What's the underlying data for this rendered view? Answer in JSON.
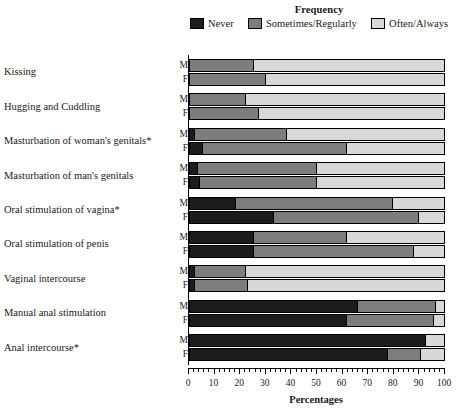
{
  "chart_data": {
    "type": "bar",
    "orientation": "horizontal",
    "stacked": true,
    "stack_total": 100,
    "title": "",
    "legend_title": "Frequency",
    "legend_position": "top",
    "xlabel": "Percentages",
    "ylabel": "",
    "xlim": [
      0,
      100
    ],
    "xticks": [
      0,
      10,
      20,
      30,
      40,
      50,
      60,
      70,
      80,
      90,
      100
    ],
    "xtick_labels": [
      "0",
      "10",
      "20",
      "30",
      "40",
      "50",
      "60",
      "70",
      "80",
      "90",
      "100"
    ],
    "minor_tick_step": 2,
    "grid": false,
    "series": [
      {
        "name": "Never",
        "color": "#1c1c1c"
      },
      {
        "name": "Sometimes/Regularly",
        "color": "#7d7d7d"
      },
      {
        "name": "Often/Always",
        "color": "#d8d8d6"
      }
    ],
    "subgroups": [
      "M",
      "F"
    ],
    "categories": [
      "Kissing",
      "Hugging and Cuddling",
      "Masturbation of woman's genitals*",
      "Masturbation of man's genitals",
      "Oral stimulation of vagina*",
      "Oral stimulation of penis",
      "Vaginal intercourse",
      "Manual anal stimulation",
      "Anal intercourse*"
    ],
    "groups": [
      {
        "category": "Kissing",
        "rows": [
          {
            "subgroup": "M",
            "values": [
              0,
              25,
              75
            ]
          },
          {
            "subgroup": "F",
            "values": [
              0,
              30,
              70
            ]
          }
        ]
      },
      {
        "category": "Hugging and Cuddling",
        "rows": [
          {
            "subgroup": "M",
            "values": [
              0,
              22,
              78
            ]
          },
          {
            "subgroup": "F",
            "values": [
              0,
              27,
              73
            ]
          }
        ]
      },
      {
        "category": "Masturbation of woman's genitals*",
        "rows": [
          {
            "subgroup": "M",
            "values": [
              2,
              36,
              62
            ]
          },
          {
            "subgroup": "F",
            "values": [
              5,
              57,
              38
            ]
          }
        ]
      },
      {
        "category": "Masturbation of man's genitals",
        "rows": [
          {
            "subgroup": "M",
            "values": [
              3,
              47,
              50
            ]
          },
          {
            "subgroup": "F",
            "values": [
              4,
              46,
              50
            ]
          }
        ]
      },
      {
        "category": "Oral stimulation of vagina*",
        "rows": [
          {
            "subgroup": "M",
            "values": [
              18,
              62,
              20
            ]
          },
          {
            "subgroup": "F",
            "values": [
              33,
              57,
              10
            ]
          }
        ]
      },
      {
        "category": "Oral stimulation of penis",
        "rows": [
          {
            "subgroup": "M",
            "values": [
              25,
              37,
              38
            ]
          },
          {
            "subgroup": "F",
            "values": [
              25,
              63,
              12
            ]
          }
        ]
      },
      {
        "category": "Vaginal intercourse",
        "rows": [
          {
            "subgroup": "M",
            "values": [
              2,
              20,
              78
            ]
          },
          {
            "subgroup": "F",
            "values": [
              2,
              21,
              77
            ]
          }
        ]
      },
      {
        "category": "Manual anal stimulation",
        "rows": [
          {
            "subgroup": "M",
            "values": [
              66,
              31,
              3
            ]
          },
          {
            "subgroup": "F",
            "values": [
              62,
              34,
              4
            ]
          }
        ]
      },
      {
        "category": "Anal intercourse*",
        "rows": [
          {
            "subgroup": "M",
            "values": [
              93,
              0,
              7
            ]
          },
          {
            "subgroup": "F",
            "values": [
              78,
              13,
              9
            ]
          }
        ]
      }
    ]
  }
}
